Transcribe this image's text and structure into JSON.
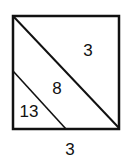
{
  "diagram": {
    "shape": "square divided by two parallel diagonal lines into three regions",
    "regions": [
      {
        "id": "upper-right-triangle",
        "label": "3"
      },
      {
        "id": "middle-band",
        "label": "8"
      },
      {
        "id": "lower-left-triangle",
        "label": "13"
      }
    ],
    "side_label": "3",
    "colors": {
      "stroke": "#111111",
      "background": "#ffffff"
    }
  }
}
